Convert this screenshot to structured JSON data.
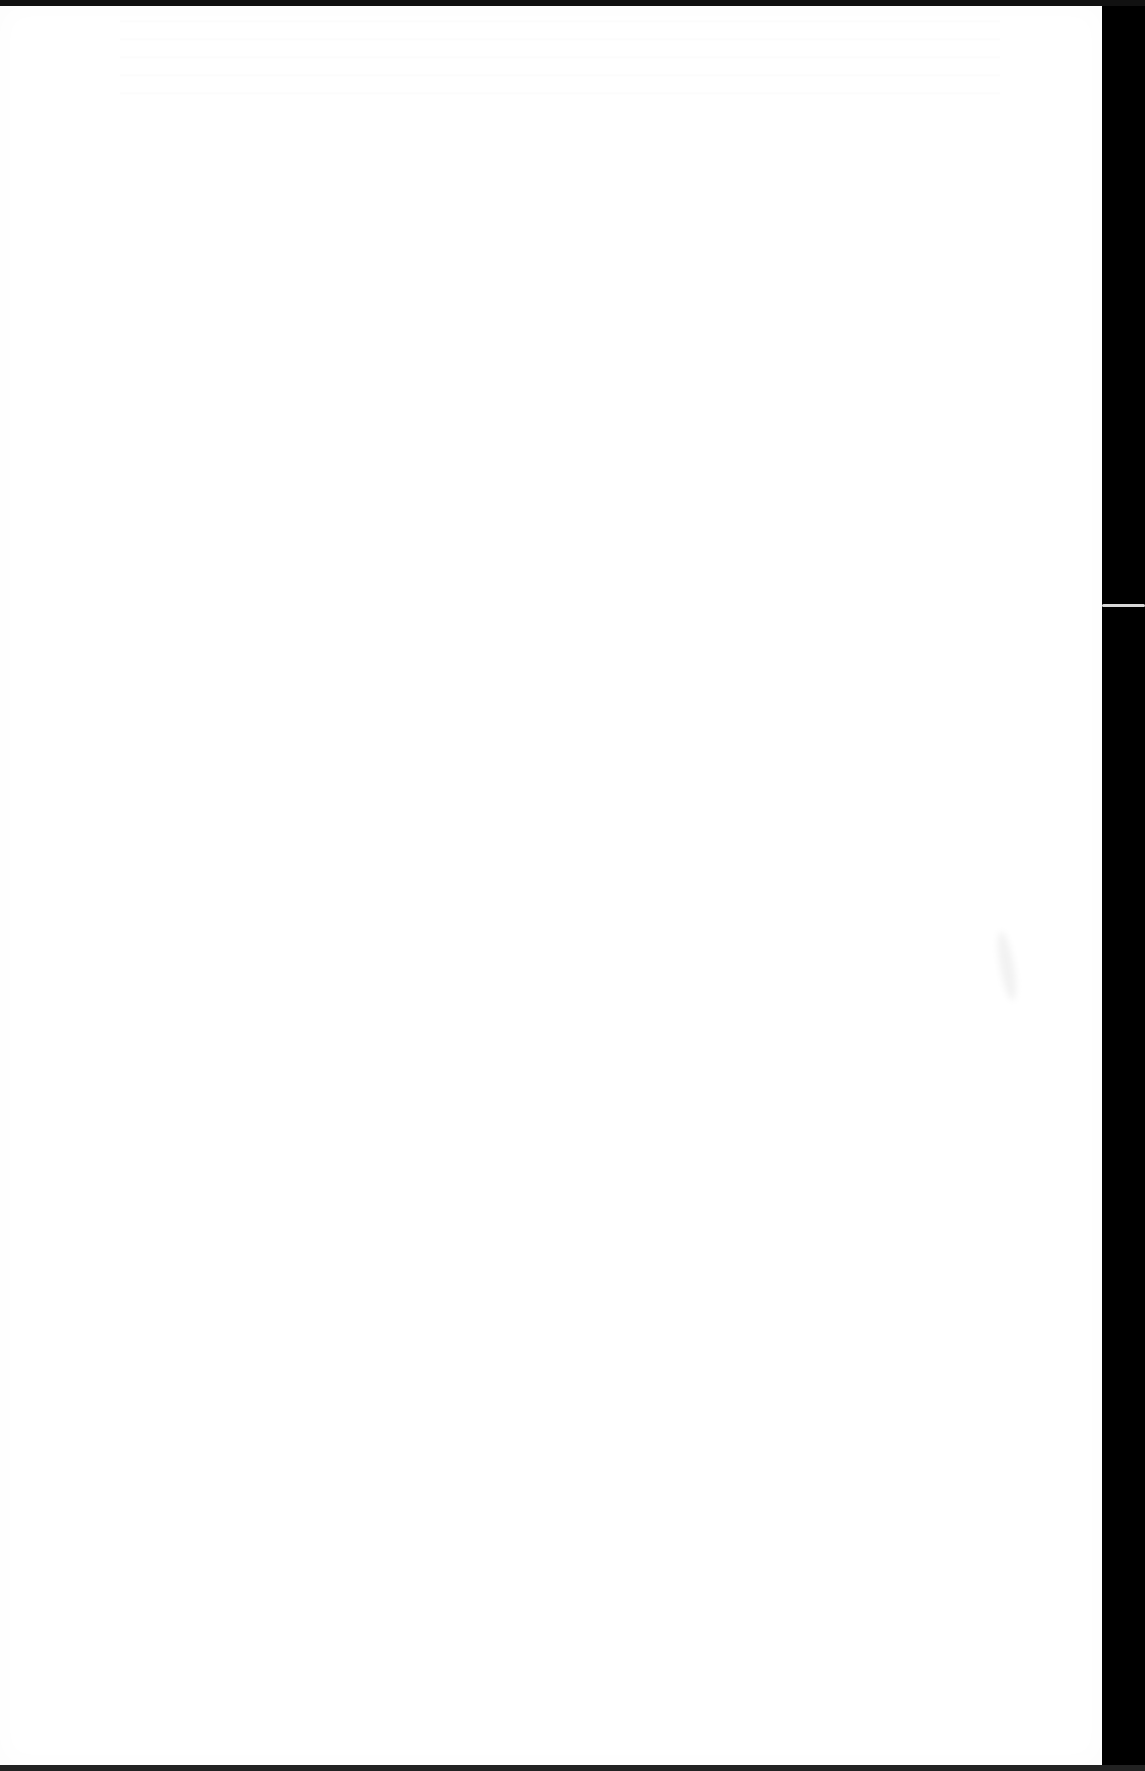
{
  "document": {
    "type": "scanned-page",
    "content": "",
    "colors": {
      "paper": "#ffffff",
      "scanner_background": "#000000"
    }
  }
}
